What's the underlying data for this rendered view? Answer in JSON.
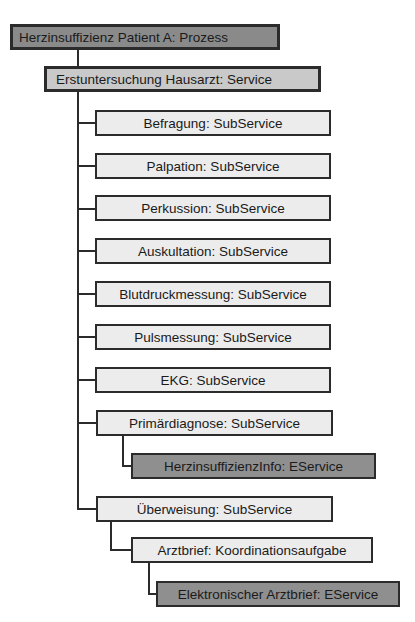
{
  "diagram": {
    "root": {
      "label": "Herzinsuffizienz Patient A: Prozess",
      "type": "Prozess"
    },
    "service": {
      "label": "Erstuntersuchung Hausarzt: Service",
      "type": "Service"
    },
    "subservices": [
      {
        "label": "Befragung: SubService"
      },
      {
        "label": "Palpation: SubService"
      },
      {
        "label": "Perkussion: SubService"
      },
      {
        "label": "Auskultation: SubService"
      },
      {
        "label": "Blutdruckmessung: SubService"
      },
      {
        "label": "Pulsmessung: SubService"
      },
      {
        "label": "EKG: SubService"
      },
      {
        "label": "Primärdiagnose: SubService"
      },
      {
        "label": "Überweisung: SubService"
      }
    ],
    "primaerdiagnose_child": {
      "label": "HerzinsuffizienzInfo: EService",
      "type": "EService"
    },
    "ueberweisung_child": {
      "label": "Arztbrief: Koordinationsaufgabe",
      "type": "Koordinationsaufgabe"
    },
    "arztbrief_child": {
      "label": "Elektronischer Arztbrief: EService",
      "type": "EService"
    },
    "colors": {
      "prozess": "#8a8a8a",
      "service": "#c9c9c9",
      "subservice": "#ececec",
      "eservice": "#8f8f8f",
      "border": "#2b2b2b"
    }
  }
}
